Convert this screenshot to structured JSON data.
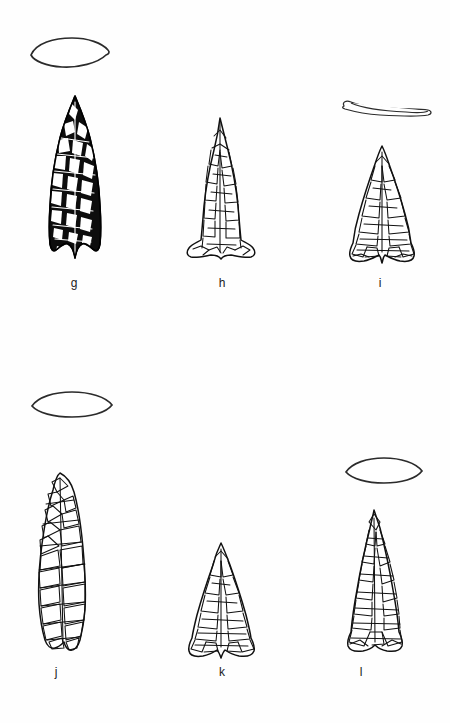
{
  "plate": {
    "background_color": "#fefefe",
    "ink_color": "#111111",
    "width": 450,
    "height": 723,
    "rows": 2,
    "columns": 3
  },
  "specimens": [
    {
      "label": "g",
      "row": 1,
      "column": 1,
      "rendering_style": "solid-black-shaded",
      "outline_form": "lanceolate-triangular",
      "base_form": "concave-eared",
      "has_cross_section": true,
      "cross_section_form": "biconvex-lenticular",
      "cross_section_thickness": "thick",
      "label_x": 74,
      "label_y": 283,
      "body_x": 44,
      "body_y": 96,
      "body_width": 62,
      "body_height": 174,
      "section_x": 28,
      "section_y": 36,
      "section_width": 80,
      "section_height": 30
    },
    {
      "label": "h",
      "row": 1,
      "column": 2,
      "rendering_style": "outline-flake-scar",
      "outline_form": "narrow-triangular",
      "base_form": "flared-concave",
      "has_cross_section": false,
      "cross_section_form": null,
      "cross_section_thickness": null,
      "label_x": 222,
      "label_y": 283,
      "body_x": 183,
      "body_y": 118,
      "body_width": 74,
      "body_height": 150,
      "section_x": null,
      "section_y": null,
      "section_width": null,
      "section_height": null
    },
    {
      "label": "i",
      "row": 1,
      "column": 3,
      "rendering_style": "outline-flake-scar",
      "outline_form": "broad-triangular",
      "base_form": "concave-eared",
      "has_cross_section": true,
      "cross_section_form": "flattened-lens",
      "cross_section_thickness": "very-thin",
      "label_x": 380,
      "label_y": 283,
      "body_x": 345,
      "body_y": 146,
      "body_width": 72,
      "body_height": 124,
      "section_x": 340,
      "section_y": 98,
      "section_width": 92,
      "section_height": 22
    },
    {
      "label": "j",
      "row": 2,
      "column": 1,
      "rendering_style": "outline-flake-scar",
      "outline_form": "elongated-lanceolate",
      "base_form": "straight-stemmed",
      "has_cross_section": true,
      "cross_section_form": "biconvex-lenticular",
      "cross_section_thickness": "medium",
      "label_x": 55,
      "label_y": 672,
      "body_x": 26,
      "body_y": 472,
      "body_width": 72,
      "body_height": 186,
      "section_x": 30,
      "section_y": 392,
      "section_width": 84,
      "section_height": 26
    },
    {
      "label": "k",
      "row": 2,
      "column": 2,
      "rendering_style": "outline-flake-scar",
      "outline_form": "equilateral-triangular",
      "base_form": "concave-eared",
      "has_cross_section": false,
      "cross_section_form": null,
      "cross_section_thickness": null,
      "label_x": 222,
      "label_y": 672,
      "body_x": 186,
      "body_y": 543,
      "body_width": 70,
      "body_height": 115,
      "section_x": null,
      "section_y": null,
      "section_width": null,
      "section_height": null
    },
    {
      "label": "l",
      "row": 2,
      "column": 3,
      "rendering_style": "outline-flake-scar",
      "outline_form": "triangular",
      "base_form": "concave-eared",
      "has_cross_section": true,
      "cross_section_form": "biconvex-lenticular",
      "cross_section_thickness": "medium",
      "label_x": 361,
      "label_y": 672,
      "body_x": 340,
      "body_y": 510,
      "body_width": 66,
      "body_height": 148,
      "section_x": 344,
      "section_y": 458,
      "section_width": 78,
      "section_height": 26
    }
  ]
}
